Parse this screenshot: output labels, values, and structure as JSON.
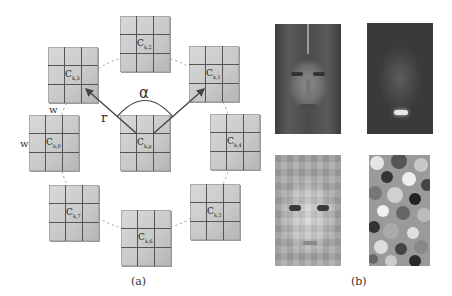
{
  "panel_a": {
    "caption": "(a)",
    "cells": [
      {
        "id": "c_k_2",
        "label": "C",
        "sub": "k,2",
        "x": 120,
        "y": 16
      },
      {
        "id": "c_k_3",
        "label": "C",
        "sub": "k,3",
        "x": 48,
        "y": 47
      },
      {
        "id": "c_k_1",
        "label": "C",
        "sub": "k,1",
        "x": 189,
        "y": 46
      },
      {
        "id": "c_k_0",
        "label": "C",
        "sub": "k,0",
        "x": 29,
        "y": 115
      },
      {
        "id": "c_k_p",
        "label": "C",
        "sub": "k,p",
        "x": 120,
        "y": 115
      },
      {
        "id": "c_k_4",
        "label": "C",
        "sub": "k,4",
        "x": 210,
        "y": 114
      },
      {
        "id": "c_k_7",
        "label": "C",
        "sub": "k,7",
        "x": 49,
        "y": 185
      },
      {
        "id": "c_k_6",
        "label": "C",
        "sub": "k,6",
        "x": 121,
        "y": 210
      },
      {
        "id": "c_k_5",
        "label": "C",
        "sub": "k,5",
        "x": 190,
        "y": 184
      }
    ],
    "radius_label": "r",
    "angle_label": "α",
    "width_label_top": "w",
    "width_label_left": "w"
  },
  "panel_b": {
    "caption": "(b)",
    "images": [
      {
        "id": "face-original",
        "description": "grayscale face photo"
      },
      {
        "id": "face-filtered-dark",
        "description": "dark filtered face response with bright lips"
      },
      {
        "id": "face-blocky-texture",
        "description": "blocky bright texture map of face"
      },
      {
        "id": "random-patch-map",
        "description": "random mottled patch pattern"
      }
    ]
  }
}
